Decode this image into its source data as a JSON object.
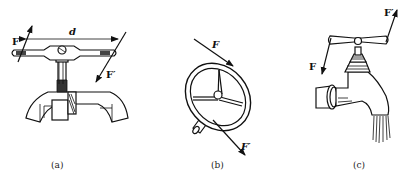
{
  "figure": {
    "panels": [
      {
        "id": "a",
        "caption": "(a)",
        "subject": "tap wrench turning a tap",
        "labels": {
          "force": "F",
          "force_prime": "F′",
          "distance": "d"
        }
      },
      {
        "id": "b",
        "caption": "(b)",
        "subject": "handwheel with shaft",
        "labels": {
          "force": "F",
          "force_prime": "F′"
        }
      },
      {
        "id": "c",
        "caption": "(c)",
        "subject": "water faucet with T-handle",
        "labels": {
          "force": "F",
          "force_prime": "F′"
        }
      }
    ]
  }
}
